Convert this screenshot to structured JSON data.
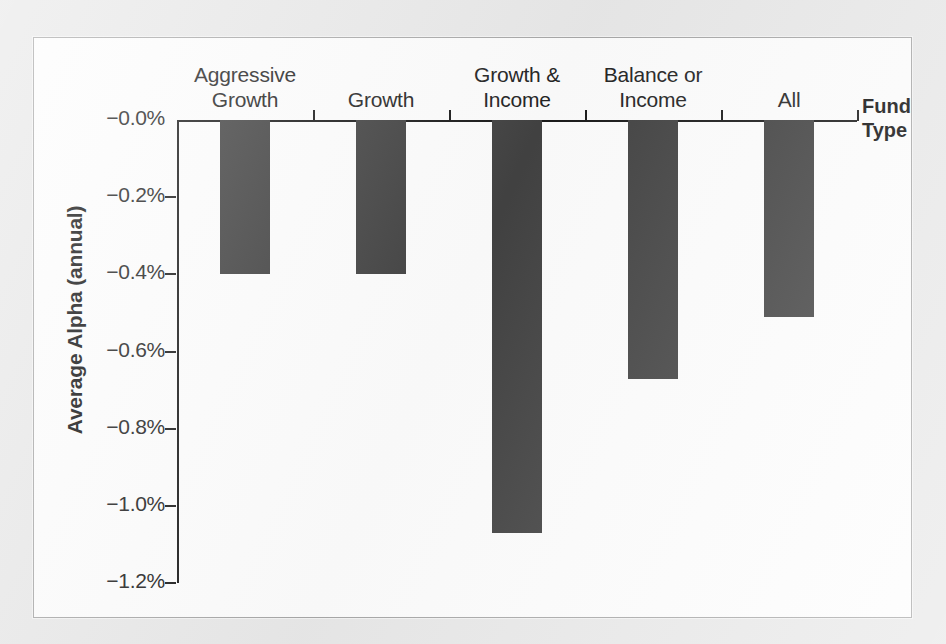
{
  "chart_data": {
    "type": "bar",
    "title": "",
    "xlabel": "Fund Type",
    "ylabel": "Average Alpha (annual)",
    "categories": [
      "Aggressive\nGrowth",
      "Growth",
      "Growth &\nIncome",
      "Balance or\nIncome",
      "All"
    ],
    "values": [
      -0.4,
      -0.4,
      -1.07,
      -0.67,
      -0.51
    ],
    "ylim": [
      -1.2,
      0.0
    ],
    "ytick_values": [
      0.0,
      -0.2,
      -0.4,
      -0.6,
      -0.8,
      -1.0,
      -1.2
    ],
    "ytick_labels": [
      "−0.0%",
      "−0.2%",
      "−0.4%",
      "−0.6%",
      "−0.8%",
      "−1.0%",
      "−1.2%"
    ],
    "grid": false,
    "legend": false,
    "bar_color": "#424242",
    "axis_color": "#1a1a1a",
    "orientation": "vertical-downward",
    "note": "All bars are negative; bars hang downward from the zero baseline at the top of the plot."
  },
  "figure": {
    "panel_background": "#fdfdfd",
    "page_background": "#e9e9e9",
    "border_color": "#a8a8a8"
  }
}
